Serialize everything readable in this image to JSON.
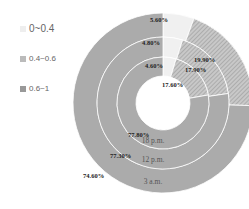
{
  "chart_data": {
    "type": "pie",
    "subtype": "multi-ring donut",
    "title": "",
    "legend": [
      "0~0.4",
      "0.4~0.6",
      "0.6~1"
    ],
    "legend_position": "left",
    "categories": [
      "0~0.4",
      "0.4~0.6",
      "0.6~1"
    ],
    "series": [
      {
        "name": "3 a.m.",
        "ring": "outer",
        "values": [
          5.6,
          19.9,
          74.6
        ],
        "labels": [
          "5.60%",
          "19.90%",
          "74.60%"
        ]
      },
      {
        "name": "12 p.m.",
        "ring": "middle",
        "values": [
          4.8,
          17.9,
          77.3
        ],
        "labels": [
          "4.80%",
          "17.90%",
          "77.30%"
        ]
      },
      {
        "name": "18 p.m.",
        "ring": "inner",
        "values": [
          4.6,
          17.6,
          77.8
        ],
        "labels": [
          "4.60%",
          "17.60%",
          "77.80%"
        ]
      }
    ],
    "colors": [
      "#eeeeee",
      "#bdbdbd",
      "#a9a9a9"
    ]
  },
  "legend": {
    "items": [
      {
        "label": "0~0.4",
        "color": "#eeeeee"
      },
      {
        "label": "0.4~0.6",
        "color": "#bdbdbd"
      },
      {
        "label": "0.6~1",
        "color": "#a9a9a9"
      }
    ]
  }
}
